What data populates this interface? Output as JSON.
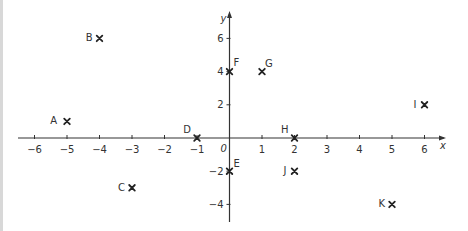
{
  "chart_data": {
    "type": "scatter",
    "title": "",
    "xlabel": "x",
    "ylabel": "y",
    "origin_label": "0",
    "xlim": [
      -6.6,
      6.6
    ],
    "ylim": [
      -5.1,
      7.5
    ],
    "grid": false,
    "marker": "x",
    "x_ticks": [
      -6,
      -5,
      -4,
      -3,
      -2,
      -1,
      1,
      2,
      3,
      4,
      5,
      6
    ],
    "y_ticks": [
      -4,
      -2,
      2,
      4,
      6
    ],
    "points": [
      {
        "label": "A",
        "x": -5,
        "y": 1
      },
      {
        "label": "B",
        "x": -4,
        "y": 6
      },
      {
        "label": "C",
        "x": -3,
        "y": -3
      },
      {
        "label": "D",
        "x": -1,
        "y": 0
      },
      {
        "label": "E",
        "x": 0,
        "y": -2
      },
      {
        "label": "F",
        "x": 0,
        "y": 4
      },
      {
        "label": "G",
        "x": 1,
        "y": 4
      },
      {
        "label": "H",
        "x": 2,
        "y": 0
      },
      {
        "label": "I",
        "x": 6,
        "y": 2
      },
      {
        "label": "J",
        "x": 2,
        "y": -2
      },
      {
        "label": "K",
        "x": 5,
        "y": -4
      }
    ],
    "axis_color": "#333333",
    "marker_color": "#222222"
  }
}
